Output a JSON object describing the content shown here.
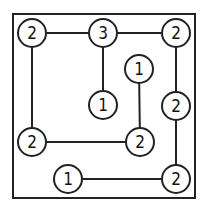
{
  "puzzle": {
    "type": "hashi",
    "frame": {
      "x": 13,
      "y": 14,
      "w": 182,
      "h": 184
    },
    "islands": [
      {
        "id": "a",
        "value": "2",
        "x": 32,
        "y": 33
      },
      {
        "id": "b",
        "value": "3",
        "x": 103,
        "y": 33
      },
      {
        "id": "c",
        "value": "2",
        "x": 176,
        "y": 33
      },
      {
        "id": "d",
        "value": "1",
        "x": 139,
        "y": 69
      },
      {
        "id": "e",
        "value": "1",
        "x": 103,
        "y": 105
      },
      {
        "id": "f",
        "value": "2",
        "x": 176,
        "y": 106
      },
      {
        "id": "g",
        "value": "2",
        "x": 32,
        "y": 142
      },
      {
        "id": "h",
        "value": "2",
        "x": 140,
        "y": 142
      },
      {
        "id": "i",
        "value": "1",
        "x": 68,
        "y": 179
      },
      {
        "id": "j",
        "value": "2",
        "x": 176,
        "y": 179
      }
    ],
    "bridges": [
      [
        "a",
        "b"
      ],
      [
        "b",
        "c"
      ],
      [
        "a",
        "g"
      ],
      [
        "b",
        "e"
      ],
      [
        "c",
        "f"
      ],
      [
        "f",
        "j"
      ],
      [
        "d",
        "h"
      ],
      [
        "g",
        "h"
      ],
      [
        "i",
        "j"
      ]
    ]
  }
}
